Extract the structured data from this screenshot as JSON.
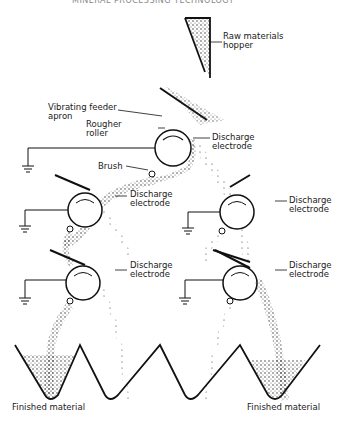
{
  "header": {
    "running_title": "MINERAL PROCESSING TECHNOLOGY"
  },
  "labels": {
    "hopper": [
      "Raw materials",
      "hopper"
    ],
    "apron": [
      "Vibrating feeder",
      "apron"
    ],
    "roller": [
      "Rougher",
      "roller"
    ],
    "brush": "Brush",
    "electrode_top": [
      "Discharge",
      "electrode"
    ],
    "electrode_mid_left": [
      "Discharge",
      "electrode"
    ],
    "electrode_mid_right": [
      "Discharge",
      "electrode"
    ],
    "electrode_low_left": [
      "Discharge",
      "electrode"
    ],
    "electrode_low_right": [
      "Discharge",
      "electrode"
    ],
    "finished_left": "Finished material",
    "finished_right": "Finished material"
  },
  "colors": {
    "ink": "#1a1a1a",
    "background": "#ffffff"
  }
}
